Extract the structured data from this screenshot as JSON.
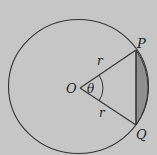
{
  "diagram": {
    "type": "circle-segment",
    "labels": {
      "center": "O",
      "point_top": "P",
      "point_bottom": "Q",
      "radius_upper": "r",
      "radius_lower": "r",
      "angle": "θ"
    },
    "colors": {
      "background": "#c6c6c6",
      "stroke": "#333333",
      "segment_fill": "#8f8f8f"
    }
  }
}
